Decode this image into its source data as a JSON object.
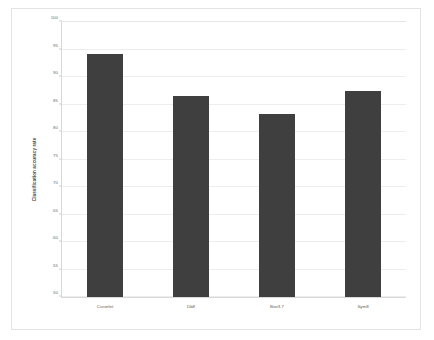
{
  "chart_data": {
    "type": "bar",
    "title": "",
    "xlabel": "",
    "ylabel": "Classification accuracy rate",
    "categories": [
      "Curvelet",
      "Db8",
      "Bior3.7",
      "Sym8"
    ],
    "values": [
      94.2,
      86.5,
      83.2,
      87.4
    ],
    "ylim": [
      50,
      100
    ],
    "ytick_step": 5,
    "yticks": [
      50,
      55,
      60,
      65,
      70,
      75,
      80,
      85,
      90,
      95,
      100
    ],
    "ytick_labels": [
      "50",
      "55",
      "60",
      "65",
      "70",
      "75",
      "80",
      "85",
      "90",
      "95",
      "100"
    ],
    "grid": true,
    "legend": false,
    "bar_color": "#3f3f3f",
    "grid_color": "#ededed",
    "axis_color": "#d8d8d8",
    "background_color": "#ffffff",
    "border_color": "#e3e3e3"
  }
}
